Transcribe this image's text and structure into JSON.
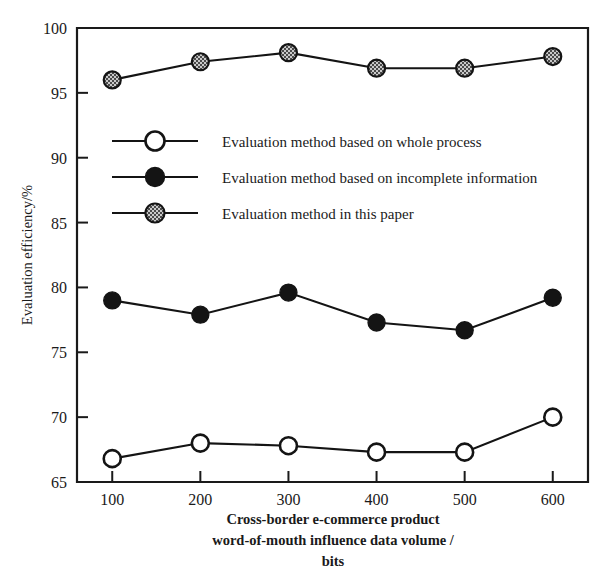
{
  "chart_data": {
    "type": "line",
    "title": "",
    "xlabel": "Cross-border e-commerce product word-of-mouth influence data volume / bits",
    "xlabel_lines": [
      "Cross-border e-commerce product",
      "word-of-mouth influence data volume /",
      "bits"
    ],
    "ylabel": "Evaluation efficiency/%",
    "x": [
      100,
      200,
      300,
      400,
      500,
      600
    ],
    "xtick_labels": [
      "100",
      "200",
      "300",
      "400",
      "500",
      "600"
    ],
    "ytick_labels": [
      "65",
      "70",
      "75",
      "80",
      "85",
      "90",
      "95",
      "100"
    ],
    "yticks": [
      65,
      70,
      75,
      80,
      85,
      90,
      95,
      100
    ],
    "xlim": [
      60,
      640
    ],
    "ylim": [
      65,
      100
    ],
    "grid": false,
    "legend_position": "upper-left-inside",
    "series": [
      {
        "name": "Evaluation method based on whole process",
        "marker": "open-circle",
        "values": [
          66.8,
          68.0,
          67.8,
          67.3,
          67.3,
          70.0
        ]
      },
      {
        "name": "Evaluation method based on incomplete information",
        "marker": "filled-circle",
        "values": [
          79.0,
          77.9,
          79.6,
          77.3,
          76.7,
          79.2
        ]
      },
      {
        "name": "Evaluation method in this paper",
        "marker": "hatched-circle",
        "values": [
          96.0,
          97.4,
          98.1,
          96.9,
          96.9,
          97.8
        ]
      }
    ]
  },
  "legend": {
    "items": [
      {
        "label": "Evaluation method based on whole process",
        "marker": "open-circle"
      },
      {
        "label": "Evaluation method based on incomplete information",
        "marker": "filled-circle"
      },
      {
        "label": "Evaluation method in this paper",
        "marker": "hatched-circle"
      }
    ]
  },
  "colors": {
    "line": "#141414",
    "open_fill": "#ffffff",
    "filled_fill": "#141414",
    "hatched_fill": "#9a9a9a",
    "axis": "#1a1a1a",
    "background": "#ffffff"
  }
}
